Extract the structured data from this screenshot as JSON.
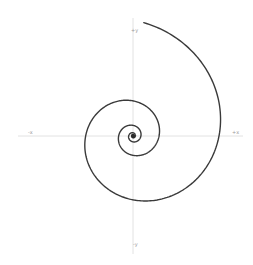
{
  "diagram": {
    "title": "",
    "type": "logarithmic spiral",
    "canvas": {
      "width": 253,
      "height": 265,
      "background": "#ffffff"
    },
    "axes": {
      "origin": [
        133,
        136
      ],
      "x_range": [
        18,
        243
      ],
      "y_range": [
        18,
        254
      ],
      "color": "#e2e2e2",
      "labels": {
        "pos_y": "+y",
        "neg_x": "-x",
        "pos_x": "+x",
        "neg_y": "-y"
      }
    },
    "spiral": {
      "color": "#3a3a3a",
      "r_at_theta0": 86,
      "growth_b": 0.19,
      "theta_start": -1.476,
      "theta_end": 20.5,
      "center_dot_radius": 2.2
    }
  }
}
